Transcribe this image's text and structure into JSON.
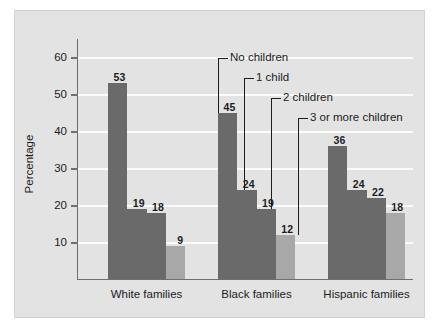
{
  "chart_data": {
    "type": "bar",
    "title": "",
    "subtitle": "",
    "xlabel": "",
    "ylabel": "Percentage",
    "ylim": [
      0,
      65
    ],
    "yticks": [
      10,
      20,
      30,
      40,
      50,
      60
    ],
    "ytick_labels": [
      "10",
      "20",
      "30",
      "40",
      "50",
      "60"
    ],
    "grid": true,
    "legend_position": "annotations-inline",
    "categories": [
      "White families",
      "Black families",
      "Hispanic families"
    ],
    "series": [
      {
        "name": "No children",
        "color": "#6a6a6a",
        "values": [
          53,
          45,
          36
        ]
      },
      {
        "name": "1 child",
        "color": "#6a6a6a",
        "values": [
          19,
          24,
          24
        ]
      },
      {
        "name": "2 children",
        "color": "#6a6a6a",
        "values": [
          18,
          19,
          22
        ]
      },
      {
        "name": "3 or more children",
        "color": "#a8a8a8",
        "values": [
          9,
          12,
          18
        ]
      }
    ],
    "annotations": [
      {
        "label": "No children",
        "target_category": "Black families",
        "target_series": "No children"
      },
      {
        "label": "1 child",
        "target_category": "Black families",
        "target_series": "1 child"
      },
      {
        "label": "2 children",
        "target_category": "Black families",
        "target_series": "2 children"
      },
      {
        "label": "3 or more children",
        "target_category": "Black families",
        "target_series": "3 or more children"
      }
    ]
  },
  "figure": {
    "background_color": "#e3e3e3",
    "gridline_color": "#fbfbfb",
    "axis_color": "#6f6f6f",
    "text_color": "#1c1c1c"
  }
}
